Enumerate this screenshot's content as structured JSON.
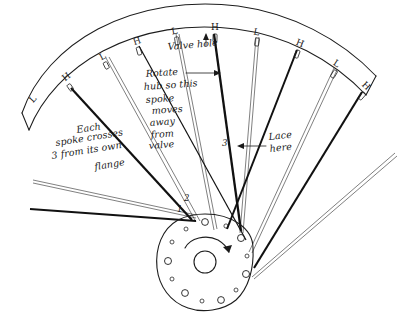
{
  "diagram": {
    "medium": "hand-drawn ink sketch",
    "background_color": "#ffffff",
    "ink_color": "#1a1a1a"
  },
  "annotations": {
    "valve_hole": {
      "label": "Valve hole",
      "x": 168,
      "y": 47,
      "rotation": -6,
      "pointer": "up-arrow-to-rim"
    },
    "rotate_note": {
      "lines": [
        "Rotate",
        "hub so this",
        "spoke",
        "moves",
        "away",
        "from",
        "valve"
      ],
      "x": 146,
      "y": 72,
      "pointer": "right-arrow-to-spoke"
    },
    "cross_note": {
      "lines": [
        "Each",
        "spoke crosses",
        "3 from its own",
        "flange"
      ],
      "x": 55,
      "y": 128
    },
    "lace_note": {
      "lines": [
        "Lace",
        "here"
      ],
      "x": 267,
      "y": 136,
      "pointer": "left-arrow-to-crossing"
    }
  },
  "crossing_numbers": [
    {
      "label": "1",
      "x": 177,
      "y": 212
    },
    {
      "label": "2",
      "x": 184,
      "y": 201
    },
    {
      "label": "3",
      "x": 229,
      "y": 143
    }
  ],
  "rim": {
    "description": "two concentric arcs forming the rim band",
    "letters_meaning": {
      "H": "spoke head on near side of hub flange",
      "L": "spoke head on far side of hub flange"
    },
    "letters": [
      {
        "label": "L",
        "x": 35,
        "y": 101
      },
      {
        "label": "H",
        "x": 68,
        "y": 79
      },
      {
        "label": "L",
        "x": 104,
        "y": 59
      },
      {
        "label": "H",
        "x": 138,
        "y": 44
      },
      {
        "label": "L",
        "x": 175,
        "y": 34
      },
      {
        "label": "H",
        "x": 215,
        "y": 30
      },
      {
        "label": "L",
        "x": 256,
        "y": 35
      },
      {
        "label": "H",
        "x": 299,
        "y": 46
      },
      {
        "label": "L",
        "x": 335,
        "y": 66
      },
      {
        "label": "H",
        "x": 364,
        "y": 88
      }
    ]
  },
  "hub": {
    "center_x": 205,
    "center_y": 262,
    "flange_radius": 48,
    "bore_radius": 11,
    "rotation_arrow": "clockwise",
    "spoke_hole_count": 12
  },
  "spokes": {
    "near_flange_style": "solid dark line",
    "far_flange_style": "thin double outline",
    "count_visible": 10
  }
}
